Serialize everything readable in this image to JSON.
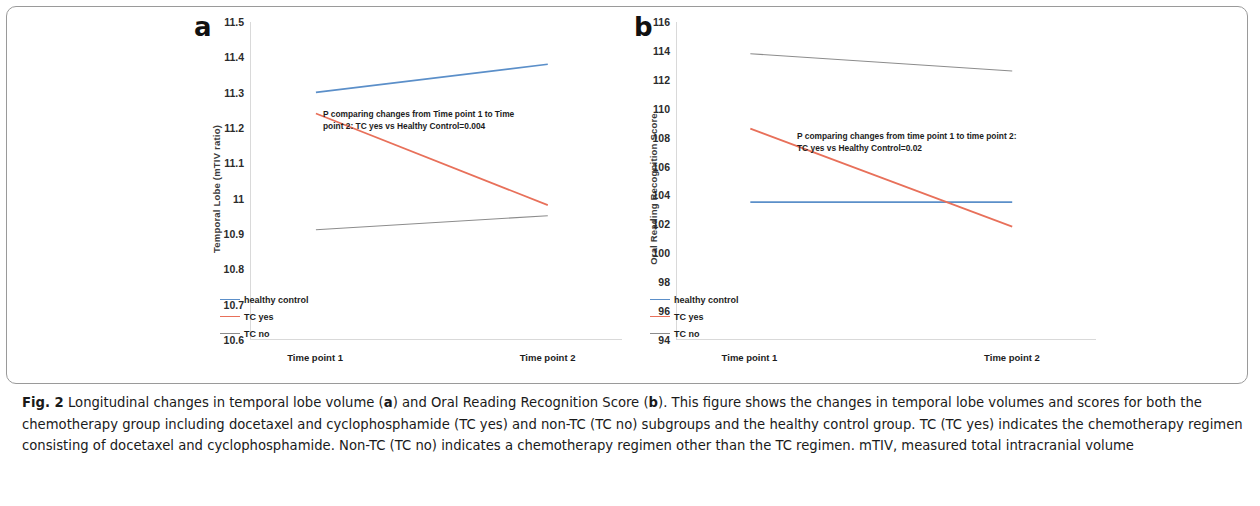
{
  "figure": {
    "label": "Fig. 2",
    "caption": "Longitudinal changes in temporal lobe volume (a) and Oral Reading Recognition Score (b). This figure shows the changes in temporal lobe volumes and scores for both the chemotherapy group including docetaxel and cyclophosphamide (TC yes) and non-TC (TC no) subgroups and the healthy control group. TC (TC yes) indicates the chemotherapy regimen consisting of docetaxel and cyclophosphamide. Non-TC (TC no) indicates a chemotherapy regimen other than the TC regimen. mTIV, measured total intracranial volume"
  },
  "colors": {
    "healthy_control": "#5b8fc9",
    "tc_yes": "#e8705a",
    "tc_no": "#8c8c8c",
    "axis": "#d9d9d9",
    "frame": "#9a9a9a",
    "text": "#1d1d1d"
  },
  "chart_data": [
    {
      "type": "line",
      "panel": "a",
      "panel_letter": "a",
      "title": "",
      "xlabel": "",
      "ylabel": "Temporal Lobe (mTIV ratio)",
      "categories": [
        "Time point 1",
        "Time point 2"
      ],
      "ylim": [
        10.6,
        11.5
      ],
      "yticks": [
        "11.5",
        "11.4",
        "11.3",
        "11.2",
        "11.1",
        "11",
        "10.9",
        "10.8",
        "10.7",
        "10.6"
      ],
      "ytick_values": [
        11.5,
        11.4,
        11.3,
        11.2,
        11.1,
        11.0,
        10.9,
        10.8,
        10.7,
        10.6
      ],
      "grid": false,
      "legend_position": "bottom-left",
      "annotation": "P comparing changes from Time point 1 to Time\npoint 2: TC yes vs Healthy Control=0.004",
      "series": [
        {
          "name": "healthy control",
          "color": "#5b8fc9",
          "values": [
            11.3,
            11.38
          ]
        },
        {
          "name": "TC yes",
          "color": "#e8705a",
          "values": [
            11.24,
            10.98
          ]
        },
        {
          "name": "TC no",
          "color": "#8c8c8c",
          "values": [
            10.91,
            10.95
          ]
        }
      ]
    },
    {
      "type": "line",
      "panel": "b",
      "panel_letter": "b",
      "title": "",
      "xlabel": "",
      "ylabel": "Oral Reading Recognition Score",
      "categories": [
        "Time point 1",
        "Time point 2"
      ],
      "ylim": [
        94,
        116
      ],
      "yticks": [
        "116",
        "114",
        "112",
        "110",
        "108",
        "106",
        "104",
        "102",
        "100",
        "98",
        "96",
        "94"
      ],
      "ytick_values": [
        116,
        114,
        112,
        110,
        108,
        106,
        104,
        102,
        100,
        98,
        96,
        94
      ],
      "grid": false,
      "legend_position": "bottom-left",
      "annotation": "P comparing changes from time point 1 to time point 2:\nTC yes vs Healthy Control=0.02",
      "series": [
        {
          "name": "healthy control",
          "color": "#5b8fc9",
          "values": [
            103.5,
            103.5
          ]
        },
        {
          "name": "TC yes",
          "color": "#e8705a",
          "values": [
            108.6,
            101.8
          ]
        },
        {
          "name": "TC no",
          "color": "#8c8c8c",
          "values": [
            113.8,
            112.6
          ]
        }
      ]
    }
  ]
}
